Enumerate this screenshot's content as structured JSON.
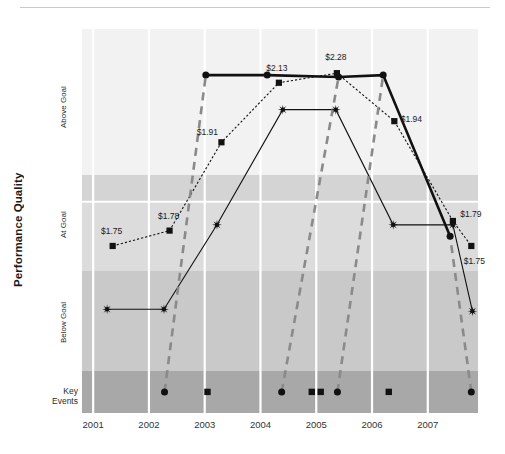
{
  "chart_data": {
    "type": "line",
    "title": "",
    "xlabel": "",
    "ylabel": "Performance Quality",
    "x": [
      2001,
      2002,
      2003,
      2004,
      2005,
      2006,
      2007
    ],
    "xlim": [
      2000.8,
      2007.9
    ],
    "ylim": [
      0,
      100
    ],
    "grid": true,
    "legend": "none",
    "y_bands": [
      {
        "label": "Above Goal",
        "color": "#f2f2f2",
        "from": 62,
        "to": 100
      },
      {
        "label": "",
        "color": "#d4d4d4",
        "from": 55,
        "to": 62
      },
      {
        "label": "At Goal",
        "color": "#dcdcdc",
        "from": 37,
        "to": 55
      },
      {
        "label": "Below Goal",
        "color": "#c9c9c9",
        "from": 11,
        "to": 37
      },
      {
        "label": "Key\nEvents",
        "color": "#a8a8a8",
        "from": 0,
        "to": 11
      }
    ],
    "band_labels": [
      "Above Goal",
      "At Goal",
      "Below Goal",
      "Key Events"
    ],
    "series": [
      {
        "name": "Earnings Per Share",
        "style": "dotted",
        "marker": "square",
        "color": "#111111",
        "points": [
          {
            "x": 2001.35,
            "y": 43.5,
            "label": "$1.75"
          },
          {
            "x": 2002.37,
            "y": 47.5,
            "label": "$1.78"
          },
          {
            "x": 2003.3,
            "y": 70.5,
            "label": "$1.91"
          },
          {
            "x": 2004.33,
            "y": 86.0,
            "label": "$2.13"
          },
          {
            "x": 2005.37,
            "y": 88.5,
            "label": "$2.28"
          },
          {
            "x": 2006.4,
            "y": 76.0,
            "label": "$1.94"
          },
          {
            "x": 2007.45,
            "y": 50.0,
            "label": "$1.79"
          },
          {
            "x": 2007.78,
            "y": 43.5,
            "label": "$1.75"
          }
        ]
      },
      {
        "name": "Customer Satisfaction",
        "style": "solid-thin",
        "marker": "starburst",
        "color": "#111111",
        "points": [
          {
            "x": 2001.25,
            "y": 27.0,
            "label": ""
          },
          {
            "x": 2002.27,
            "y": 27.0,
            "label": ""
          },
          {
            "x": 2003.22,
            "y": 49.0,
            "label": ""
          },
          {
            "x": 2004.4,
            "y": 79.0,
            "label": ""
          },
          {
            "x": 2005.35,
            "y": 79.0,
            "label": ""
          },
          {
            "x": 2006.38,
            "y": 49.0,
            "label": ""
          },
          {
            "x": 2007.45,
            "y": 49.0,
            "label": ""
          },
          {
            "x": 2007.8,
            "y": 26.5,
            "label": ""
          }
        ]
      },
      {
        "name": "Employee Engagement",
        "style": "solid-thick",
        "marker": "circle",
        "color": "#111111",
        "points": [
          {
            "x": 2003.02,
            "y": 88.0,
            "label": ""
          },
          {
            "x": 2004.12,
            "y": 88.0,
            "label": ""
          },
          {
            "x": 2005.4,
            "y": 87.5,
            "label": ""
          },
          {
            "x": 2006.2,
            "y": 88.0,
            "label": ""
          },
          {
            "x": 2007.4,
            "y": 46.0,
            "label": ""
          }
        ]
      },
      {
        "name": "Key Event Connectors",
        "style": "dashed",
        "marker": "none",
        "color": "#8a8a8a",
        "points": [
          {
            "x": 2002.28,
            "y": 5.5,
            "label": ""
          },
          {
            "x": 2003.02,
            "y": 88.0,
            "label": ""
          }
        ]
      },
      {
        "name": "Key Event Connector 2",
        "style": "dashed",
        "marker": "none",
        "color": "#8a8a8a",
        "points": [
          {
            "x": 2004.38,
            "y": 5.5,
            "label": ""
          },
          {
            "x": 2005.4,
            "y": 87.5,
            "label": ""
          }
        ]
      },
      {
        "name": "Key Event Connector 3",
        "style": "dashed",
        "marker": "none",
        "color": "#8a8a8a",
        "points": [
          {
            "x": 2005.38,
            "y": 5.5,
            "label": ""
          },
          {
            "x": 2006.2,
            "y": 88.0,
            "label": ""
          }
        ]
      },
      {
        "name": "Key Event Connector 4",
        "style": "dashed",
        "marker": "none",
        "color": "#8a8a8a",
        "points": [
          {
            "x": 2007.78,
            "y": 5.5,
            "label": ""
          },
          {
            "x": 2007.4,
            "y": 46.0,
            "label": ""
          }
        ]
      }
    ],
    "key_events": [
      {
        "x": 2002.28,
        "marker": "circle"
      },
      {
        "x": 2003.05,
        "marker": "square"
      },
      {
        "x": 2004.38,
        "marker": "circle"
      },
      {
        "x": 2004.92,
        "marker": "square"
      },
      {
        "x": 2005.08,
        "marker": "square"
      },
      {
        "x": 2005.38,
        "marker": "circle"
      },
      {
        "x": 2006.3,
        "marker": "square"
      },
      {
        "x": 2007.78,
        "marker": "circle"
      }
    ],
    "horizontal_gridlines": [
      62,
      37,
      11
    ],
    "white_gridline_y": [
      55
    ],
    "tick_labels": [
      "2001",
      "2002",
      "2003",
      "2004",
      "2005",
      "2006",
      "2007"
    ]
  }
}
